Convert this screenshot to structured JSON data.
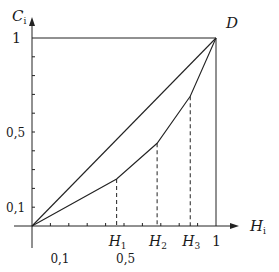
{
  "diagram": {
    "type": "lorenz-style concentration curve",
    "y_axis": {
      "label_main": "C",
      "label_sub": "i",
      "ticks": [
        {
          "value": 0.1,
          "label": "0,1"
        },
        {
          "value": 0.5,
          "label": "0,5"
        },
        {
          "value": 1,
          "label": "1"
        }
      ]
    },
    "x_axis": {
      "label_main": "H",
      "label_sub": "i",
      "ticks_minor": [
        0.1,
        0.2,
        0.3,
        0.4,
        0.5,
        0.6,
        0.7,
        0.8,
        0.9
      ],
      "labels_bottom": [
        {
          "value": 0.1,
          "label": "0,1"
        },
        {
          "value": 0.5,
          "label": "0,5"
        },
        {
          "value": 1,
          "label": "1"
        }
      ]
    },
    "point_D": {
      "label": "D",
      "x": 1,
      "y": 1
    },
    "diagonal": {
      "from": [
        0,
        0
      ],
      "to": [
        1,
        1
      ]
    },
    "curve_points": [
      {
        "x": 0,
        "y": 0
      },
      {
        "x": 0.46,
        "y": 0.25,
        "label_main": "H",
        "label_sub": "1"
      },
      {
        "x": 0.68,
        "y": 0.44,
        "label_main": "H",
        "label_sub": "2"
      },
      {
        "x": 0.86,
        "y": 0.69,
        "label_main": "H",
        "label_sub": "3"
      },
      {
        "x": 1,
        "y": 1
      }
    ],
    "y_minor_ticks": [
      0.1,
      0.2,
      0.3,
      0.4,
      0.5,
      0.6,
      0.7,
      0.8,
      0.9
    ]
  }
}
